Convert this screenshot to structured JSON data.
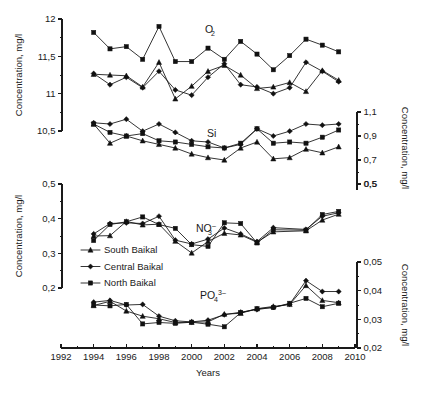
{
  "figure": {
    "x_axis_title": "Years",
    "left_axis_title_top": "Concentration, mg/l",
    "left_axis_title_bottom": "Concentration, mg/l",
    "right_axis_title_top": "Concentration, mg/l",
    "right_axis_title_bottom": "Concentration, mg/l"
  },
  "legend": {
    "items": [
      {
        "label": "South Baikal",
        "marker": "triangle"
      },
      {
        "label": "Central Baikal",
        "marker": "diamond"
      },
      {
        "label": "North Baikal",
        "marker": "square"
      }
    ]
  },
  "x_axis": {
    "min": 1992,
    "max": 2010,
    "major_ticks": [
      1992,
      1994,
      1996,
      1998,
      2000,
      2002,
      2004,
      2006,
      2008,
      2010
    ],
    "minor_ticks": [
      1993,
      1995,
      1997,
      1999,
      2001,
      2003,
      2005,
      2007,
      2009
    ],
    "labels": [
      "1992",
      "1994",
      "1996",
      "1998",
      "2000",
      "2002",
      "2004",
      "2006",
      "2008",
      "2010"
    ]
  },
  "chart_data": [
    {
      "type": "line",
      "title": "O2",
      "title_base": "O",
      "title_sub": "2",
      "axis_side": "left",
      "xlabel": "Years",
      "ylabel": "Concentration, mg/l",
      "ylim": [
        10.5,
        12
      ],
      "yticks": [
        10.5,
        11,
        11.5,
        12
      ],
      "ytick_labels": [
        "10,5",
        "11",
        "11,5",
        "12"
      ],
      "grid": false,
      "legend_position": "middle-left",
      "x": [
        1994,
        1995,
        1996,
        1997,
        1998,
        1999,
        2000,
        2001,
        2002,
        2003,
        2004,
        2005,
        2006,
        2007,
        2008,
        2009
      ],
      "series": [
        {
          "name": "North Baikal",
          "marker": "square",
          "values": [
            11.82,
            11.6,
            11.63,
            11.46,
            11.9,
            11.43,
            11.43,
            11.61,
            11.46,
            11.7,
            11.53,
            11.32,
            11.51,
            11.73,
            11.65,
            11.56
          ]
        },
        {
          "name": "Central Baikal",
          "marker": "diamond",
          "values": [
            11.27,
            11.12,
            11.22,
            11.08,
            11.3,
            11.05,
            10.98,
            11.22,
            11.4,
            11.12,
            11.09,
            11.0,
            11.08,
            11.42,
            11.3,
            11.16
          ]
        },
        {
          "name": "South Baikal",
          "marker": "triangle",
          "values": [
            11.26,
            11.25,
            11.24,
            11.09,
            11.42,
            10.93,
            11.1,
            11.3,
            11.38,
            11.25,
            11.07,
            11.09,
            11.15,
            11.03,
            11.31,
            11.18
          ]
        }
      ]
    },
    {
      "type": "line",
      "title": "Si",
      "title_base": "Si",
      "title_sub": "",
      "axis_side": "right",
      "xlabel": "Years",
      "ylabel": "Concentration, mg/l",
      "ylim": [
        0.5,
        1.1
      ],
      "yticks": [
        0.5,
        0.7,
        0.9,
        1.1
      ],
      "ytick_labels": [
        "0,5",
        "0,7",
        "0,9",
        "1,1"
      ],
      "grid": false,
      "legend_position": "middle-left",
      "x": [
        1994,
        1995,
        1996,
        1997,
        1998,
        1999,
        2000,
        2001,
        2002,
        2003,
        2004,
        2005,
        2006,
        2007,
        2008,
        2009
      ],
      "series": [
        {
          "name": "Central Baikal",
          "marker": "diamond",
          "values": [
            1.01,
            1.0,
            1.04,
            0.94,
            1.0,
            0.93,
            0.86,
            0.85,
            0.8,
            0.83,
            0.96,
            0.9,
            0.94,
            1.0,
            0.99,
            1.0
          ]
        },
        {
          "name": "North Baikal",
          "marker": "square",
          "values": [
            1.0,
            0.93,
            0.9,
            0.92,
            0.86,
            0.85,
            0.83,
            0.81,
            0.8,
            0.84,
            0.96,
            0.84,
            0.85,
            0.84,
            0.89,
            0.95
          ]
        },
        {
          "name": "South Baikal",
          "marker": "triangle",
          "values": [
            1.0,
            0.84,
            0.9,
            0.86,
            0.83,
            0.8,
            0.75,
            0.72,
            0.7,
            0.8,
            0.85,
            0.71,
            0.72,
            0.79,
            0.76,
            0.81
          ]
        }
      ]
    },
    {
      "type": "line",
      "title": "NO3-",
      "title_base": "NO",
      "title_sub": "3",
      "title_sup": "–",
      "axis_side": "left",
      "xlabel": "Years",
      "ylabel": "Concentration, mg/l",
      "ylim": [
        0.2,
        0.5
      ],
      "yticks": [
        0.2,
        0.3,
        0.4,
        0.5
      ],
      "ytick_labels": [
        "0,2",
        "0,3",
        "0,4",
        "0,5"
      ],
      "right_axis_ticks": [
        0.5
      ],
      "right_axis_tick_labels": [
        "0,5"
      ],
      "grid": false,
      "legend_position": "middle-left",
      "x": [
        1994,
        1995,
        1996,
        1997,
        1998,
        1999,
        2000,
        2001,
        2002,
        2003,
        2004,
        2005,
        2007,
        2008,
        2009
      ],
      "series": [
        {
          "name": "North Baikal",
          "marker": "square",
          "values": [
            0.337,
            0.383,
            0.391,
            0.405,
            0.383,
            0.372,
            0.325,
            0.32,
            0.388,
            0.386,
            0.33,
            0.368,
            0.367,
            0.412,
            0.421
          ]
        },
        {
          "name": "Central Baikal",
          "marker": "diamond",
          "values": [
            0.356,
            0.386,
            0.388,
            0.386,
            0.407,
            0.338,
            0.327,
            0.341,
            0.373,
            0.356,
            0.334,
            0.374,
            0.369,
            0.407,
            0.417
          ]
        },
        {
          "name": "South Baikal",
          "marker": "triangle",
          "values": [
            0.35,
            0.351,
            0.392,
            0.382,
            0.384,
            0.335,
            0.301,
            0.334,
            0.358,
            0.353,
            0.332,
            0.362,
            0.365,
            0.396,
            0.413
          ]
        }
      ]
    },
    {
      "type": "line",
      "title": "PO43-",
      "title_base": "PO",
      "title_sub": "4",
      "title_sup": "3–",
      "axis_side": "right",
      "xlabel": "Years",
      "ylabel": "Concentration, mg/l",
      "ylim": [
        0.02,
        0.05
      ],
      "yticks": [
        0.02,
        0.03,
        0.04,
        0.05
      ],
      "ytick_labels": [
        "0,02",
        "0,03",
        "0,04",
        "0,05"
      ],
      "grid": false,
      "legend_position": "middle-left",
      "x": [
        1994,
        1995,
        1996,
        1997,
        1998,
        1999,
        2000,
        2001,
        2002,
        2003,
        2004,
        2005,
        2006,
        2007,
        2008,
        2009
      ],
      "series": [
        {
          "name": "Central Baikal",
          "marker": "diamond",
          "values": [
            0.036,
            0.0366,
            0.035,
            0.0352,
            0.0311,
            0.0295,
            0.0291,
            0.0297,
            0.0316,
            0.0325,
            0.0334,
            0.0342,
            0.0353,
            0.0435,
            0.0397,
            0.0397
          ]
        },
        {
          "name": "South Baikal",
          "marker": "triangle",
          "values": [
            0.0348,
            0.0363,
            0.0329,
            0.0311,
            0.0302,
            0.0289,
            0.029,
            0.0291,
            0.0318,
            0.0321,
            0.0337,
            0.0345,
            0.0352,
            0.0418,
            0.0366,
            0.0358
          ]
        },
        {
          "name": "North Baikal",
          "marker": "square",
          "values": [
            0.035,
            0.0347,
            0.0352,
            0.0284,
            0.0289,
            0.0286,
            0.029,
            0.0283,
            0.0274,
            0.0323,
            0.0337,
            0.0341,
            0.0356,
            0.0373,
            0.0344,
            0.0356
          ]
        }
      ]
    }
  ]
}
